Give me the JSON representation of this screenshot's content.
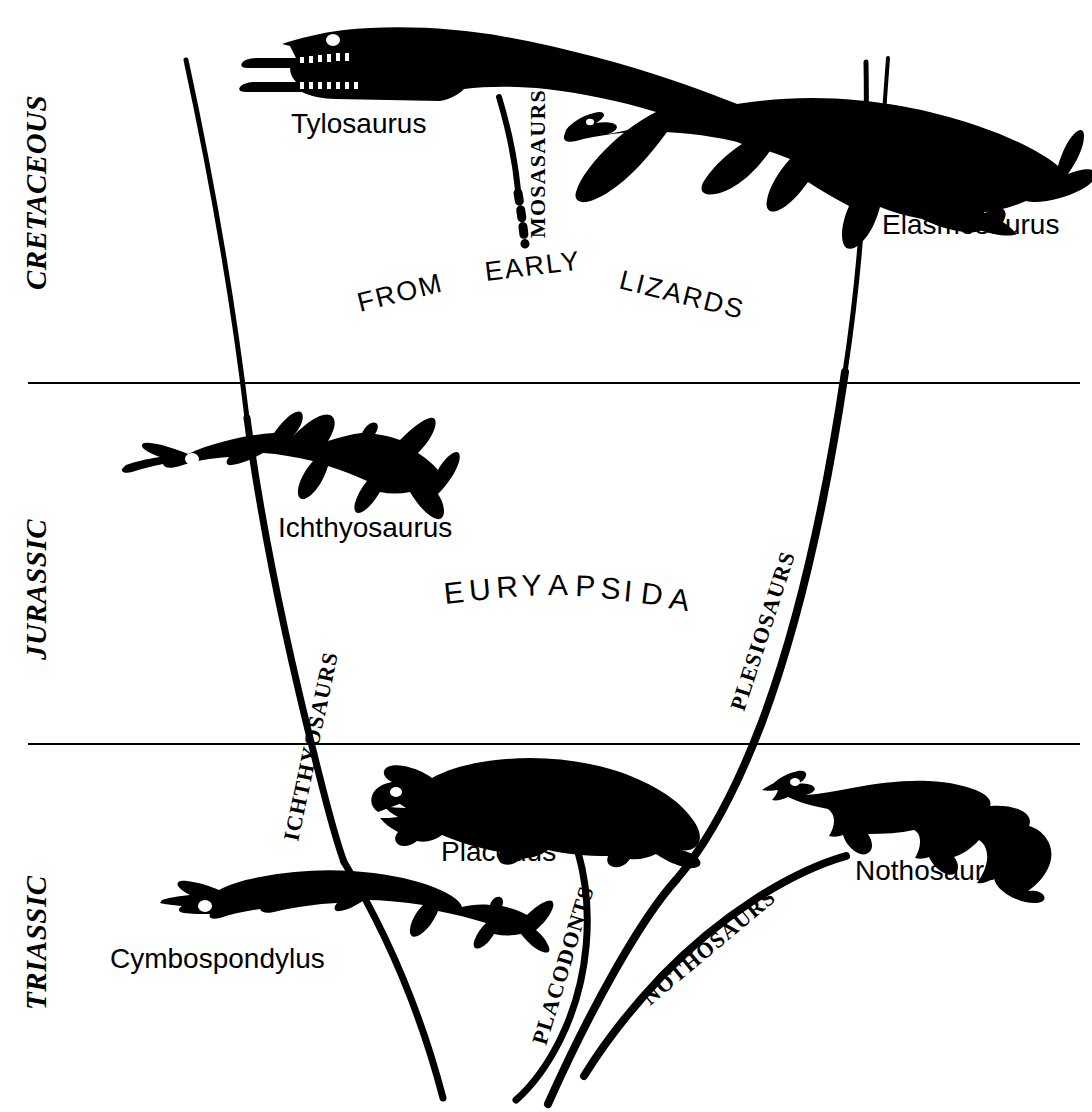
{
  "diagram": {
    "title_visible": false,
    "background_color": "#ffffff",
    "ink_color": "#000000",
    "width": 1092,
    "height": 1112
  },
  "eras": [
    {
      "id": "cretaceous",
      "label": "CRETACEOUS",
      "x": 34,
      "y": 200
    },
    {
      "id": "jurassic",
      "label": "JURASSIC",
      "x": 34,
      "y": 590
    },
    {
      "id": "triassic",
      "label": "TRIASSIC",
      "x": 34,
      "y": 940
    }
  ],
  "dividers": [
    {
      "id": "cretaceous-jurassic",
      "y": 383,
      "x1": 28,
      "x2": 1080
    },
    {
      "id": "jurassic-triassic",
      "y": 744,
      "x1": 28,
      "x2": 1080
    }
  ],
  "genera": [
    {
      "id": "tylosaurus",
      "label": "Tylosaurus",
      "x": 291,
      "y": 133,
      "size": 27
    },
    {
      "id": "elasmosaurus",
      "label": "Elasmosaurus",
      "x": 882,
      "y": 234,
      "size": 27
    },
    {
      "id": "ichthyosaurus",
      "label": "Ichthyosaurus",
      "x": 278,
      "y": 537,
      "size": 27
    },
    {
      "id": "placodus",
      "label": "Placodus",
      "x": 441,
      "y": 861,
      "size": 27
    },
    {
      "id": "nothosaurus",
      "label": "Nothosaurus",
      "x": 855,
      "y": 880,
      "size": 27
    },
    {
      "id": "cymbospondylus",
      "label": "Cymbospondylus",
      "x": 110,
      "y": 968,
      "size": 27
    }
  ],
  "taxon_branches": [
    {
      "id": "mosasaurs",
      "label": "MOSASAURS",
      "rotation": -90,
      "x": 545,
      "y": 232
    },
    {
      "id": "plesiosaurs",
      "label": "PLESIOSAURS",
      "rotation": -72,
      "x": 762,
      "y": 704
    },
    {
      "id": "ichthyosaurs",
      "label": "ICHTHYOSAURS",
      "rotation": -78,
      "x": 300,
      "y": 838
    },
    {
      "id": "placodonts",
      "label": "PLACODONTS",
      "rotation": -75,
      "x": 552,
      "y": 1042
    },
    {
      "id": "nothosaurs",
      "label": "NOTHOSAURS",
      "rotation": -40,
      "x": 662,
      "y": 1000
    }
  ],
  "phrases": [
    {
      "id": "from",
      "label": "FROM",
      "rotation": -15,
      "x": 360,
      "y": 308
    },
    {
      "id": "early",
      "label": "EARLY",
      "rotation": -8,
      "x": 486,
      "y": 277
    },
    {
      "id": "lizards",
      "label": "LIZARDS",
      "rotation": 14,
      "x": 620,
      "y": 286
    }
  ],
  "clade": {
    "id": "euryapsida",
    "label": "EURYAPSIDA",
    "letters": [
      "E",
      "U",
      "R",
      "Y",
      "A",
      "P",
      "S",
      "I",
      "D",
      "A"
    ],
    "x": 445,
    "y": 600
  }
}
